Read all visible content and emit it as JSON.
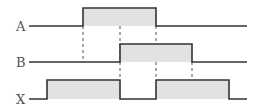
{
  "diagram": {
    "type": "timing-diagram",
    "colors": {
      "line": "#333333",
      "fill": "#e2e2e2",
      "dash": "#555555",
      "label": "#555555"
    },
    "signals": [
      {
        "name": "A",
        "baseline_y": 26,
        "high_y": 8,
        "pulses": [
          [
            83,
            156
          ]
        ]
      },
      {
        "name": "B",
        "baseline_y": 62,
        "high_y": 44,
        "pulses": [
          [
            120,
            192
          ]
        ]
      },
      {
        "name": "X",
        "baseline_y": 99,
        "high_y": 80,
        "pulses": [
          [
            47,
            120
          ],
          [
            156,
            229
          ]
        ]
      }
    ],
    "dashed_guides": [
      {
        "x": 83,
        "y1": 26,
        "y2": 62
      },
      {
        "x": 120,
        "y1": 26,
        "y2": 80
      },
      {
        "x": 156,
        "y1": 26,
        "y2": 80
      },
      {
        "x": 192,
        "y1": 62,
        "y2": 80
      }
    ],
    "line_start_x": 29,
    "line_end_x": 247
  }
}
